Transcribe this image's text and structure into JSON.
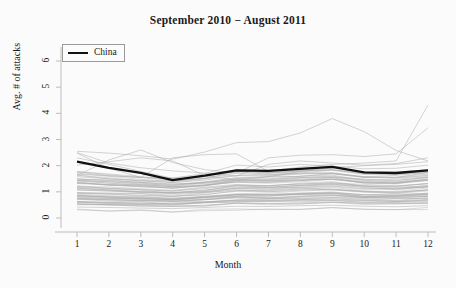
{
  "chart_data": {
    "type": "line",
    "title": "September 2010 − August 2011",
    "xlabel": "Month",
    "ylabel": "Avg. # of attacks",
    "xlim": [
      1,
      12
    ],
    "ylim": [
      0,
      6.3
    ],
    "xticks": [
      1,
      2,
      3,
      4,
      5,
      6,
      7,
      8,
      9,
      10,
      11,
      12
    ],
    "yticks": [
      0,
      1,
      2,
      3,
      4,
      5,
      6
    ],
    "grid": false,
    "legend": {
      "position": "top-left",
      "entries": [
        {
          "label": "China",
          "color": "#111111",
          "width": 2.2
        }
      ]
    },
    "x": [
      1,
      2,
      3,
      4,
      5,
      6,
      7,
      8,
      9,
      10,
      11,
      12
    ],
    "highlight_series": {
      "name": "China",
      "color": "#111111",
      "values": [
        2.15,
        1.92,
        1.72,
        1.45,
        1.62,
        1.82,
        1.8,
        1.88,
        1.95,
        1.74,
        1.72,
        1.82
      ]
    },
    "background_series_color": "#a8a8a8",
    "background_series_count": 64,
    "series": [
      {
        "name": "other-1",
        "values": [
          2.55,
          2.48,
          2.38,
          2.25,
          2.52,
          2.88,
          2.92,
          3.25,
          3.8,
          3.3,
          2.58,
          2.18
        ]
      },
      {
        "name": "other-2",
        "values": [
          2.48,
          1.9,
          1.55,
          2.3,
          2.42,
          2.45,
          1.78,
          1.95,
          2.05,
          2.1,
          2.18,
          4.32
        ]
      },
      {
        "name": "other-3",
        "values": [
          1.62,
          2.22,
          2.6,
          2.12,
          1.85,
          1.72,
          2.3,
          2.4,
          2.42,
          2.35,
          2.45,
          3.45
        ]
      },
      {
        "name": "other-4",
        "values": [
          2.5,
          2.1,
          1.92,
          1.8,
          1.72,
          1.6,
          2.05,
          2.18,
          2.1,
          2.02,
          2.08,
          2.3
        ]
      },
      {
        "name": "other-5",
        "values": [
          2.02,
          2.15,
          2.3,
          2.18,
          1.62,
          1.45,
          1.58,
          1.78,
          1.92,
          2.0,
          2.05,
          2.15
        ]
      },
      {
        "name": "other-6",
        "values": [
          2.3,
          2.05,
          1.78,
          1.52,
          1.7,
          2.02,
          1.95,
          2.05,
          1.98,
          1.88,
          1.9,
          2.02
        ]
      },
      {
        "name": "other-7",
        "values": [
          1.75,
          1.62,
          1.55,
          1.48,
          1.58,
          1.8,
          1.72,
          1.8,
          1.85,
          1.7,
          1.68,
          1.8
        ]
      },
      {
        "name": "other-8",
        "values": [
          1.58,
          1.5,
          1.42,
          1.35,
          1.45,
          1.62,
          1.6,
          1.68,
          1.72,
          1.58,
          1.56,
          1.68
        ]
      },
      {
        "name": "other-9",
        "values": [
          1.45,
          1.38,
          1.3,
          1.25,
          1.35,
          1.5,
          1.48,
          1.55,
          1.6,
          1.46,
          1.44,
          1.55
        ]
      },
      {
        "name": "other-10",
        "values": [
          1.32,
          1.26,
          1.2,
          1.14,
          1.24,
          1.38,
          1.36,
          1.43,
          1.48,
          1.35,
          1.33,
          1.43
        ]
      },
      {
        "name": "other-11",
        "values": [
          1.2,
          1.14,
          1.08,
          1.03,
          1.12,
          1.26,
          1.24,
          1.3,
          1.35,
          1.23,
          1.21,
          1.31
        ]
      },
      {
        "name": "other-12",
        "values": [
          1.08,
          1.03,
          0.97,
          0.93,
          1.01,
          1.14,
          1.12,
          1.18,
          1.23,
          1.12,
          1.1,
          1.19
        ]
      },
      {
        "name": "other-13",
        "values": [
          0.96,
          0.92,
          0.87,
          0.83,
          0.9,
          1.02,
          1.0,
          1.06,
          1.1,
          1.0,
          0.98,
          1.07
        ]
      },
      {
        "name": "other-14",
        "values": [
          0.85,
          0.81,
          0.77,
          0.74,
          0.8,
          0.9,
          0.89,
          0.94,
          0.98,
          0.89,
          0.87,
          0.95
        ]
      },
      {
        "name": "other-15",
        "values": [
          0.74,
          0.7,
          0.67,
          0.64,
          0.7,
          0.79,
          0.78,
          0.82,
          0.86,
          0.78,
          0.76,
          0.83
        ]
      },
      {
        "name": "other-16",
        "values": [
          0.63,
          0.6,
          0.57,
          0.55,
          0.6,
          0.68,
          0.67,
          0.7,
          0.74,
          0.67,
          0.65,
          0.71
        ]
      },
      {
        "name": "other-17",
        "values": [
          0.52,
          0.5,
          0.47,
          0.45,
          0.49,
          0.56,
          0.55,
          0.58,
          0.61,
          0.55,
          0.54,
          0.59
        ]
      },
      {
        "name": "other-18",
        "values": [
          0.42,
          0.4,
          0.38,
          0.36,
          0.4,
          0.45,
          0.44,
          0.47,
          0.49,
          0.45,
          0.43,
          0.47
        ]
      }
    ]
  }
}
